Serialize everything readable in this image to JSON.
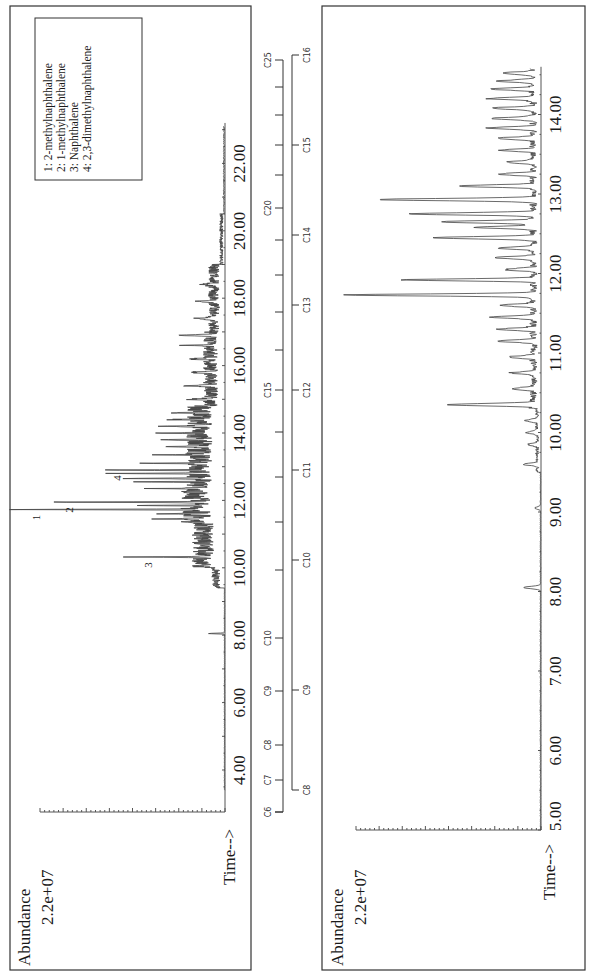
{
  "figure": {
    "orientation": "rotated-90-ccw",
    "panels": 2
  },
  "top_chart": {
    "ylabel": "Abundance",
    "ymax_label": "2.2e+07",
    "xlabel": "Time-->",
    "ticks": [
      "4.00",
      "6.00",
      "8.00",
      "10.00",
      "12.00",
      "14.00",
      "16.00",
      "18.00",
      "20.00",
      "22.00"
    ],
    "tick_values": [
      4,
      6,
      8,
      10,
      12,
      14,
      16,
      18,
      20,
      22
    ],
    "legend": [
      "1:  2-methylnaphthalene",
      "2:  1-methylnaphthalene",
      "3:  Naphthalene",
      "4:  2,3-dimethylnaphthalene"
    ],
    "peak_labels": [
      {
        "label": "1",
        "t": 11.73,
        "h": 1.0
      },
      {
        "label": "2",
        "t": 11.95,
        "h": 0.82
      },
      {
        "label": "3",
        "t": 10.32,
        "h": 0.39
      },
      {
        "label": "4",
        "t": 12.9,
        "h": 0.56
      }
    ]
  },
  "bottom_chart": {
    "ylabel": "Abundance",
    "ymax_label": "2.2e+07",
    "xlabel": "Time-->",
    "ticks": [
      "5.00",
      "6.00",
      "7.00",
      "8.00",
      "9.00",
      "10.00",
      "11.00",
      "12.00",
      "13.00",
      "14.00"
    ],
    "tick_values": [
      5,
      6,
      7,
      8,
      9,
      10,
      11,
      12,
      13,
      14
    ]
  },
  "carbon_scale_top": {
    "labels": [
      "C6",
      "C7",
      "C8",
      "C9",
      "C10",
      "C15",
      "C20",
      "C25"
    ],
    "label_positions": [
      6,
      7,
      8,
      9,
      10,
      15,
      20,
      25
    ]
  },
  "carbon_scale_bottom": {
    "labels": [
      "C8",
      "C9",
      "C10",
      "C11",
      "C12",
      "C13",
      "C14",
      "C15",
      "C16"
    ]
  },
  "chart_data": [
    {
      "type": "line",
      "title": "GC-MS total ion chromatogram (full range)",
      "xlabel": "Time-->",
      "ylabel": "Abundance",
      "xlim": [
        3.3,
        23.2
      ],
      "ylim": [
        0,
        22000000
      ],
      "x_ticks": [
        4,
        6,
        8,
        10,
        12,
        14,
        16,
        18,
        20,
        22
      ],
      "annotations": [
        {
          "peak": "1",
          "compound": "2-methylnaphthalene",
          "time_min": 11.73,
          "rel_abundance": 1.0
        },
        {
          "peak": "2",
          "compound": "1-methylnaphthalene",
          "time_min": 11.95,
          "rel_abundance": 0.82
        },
        {
          "peak": "3",
          "compound": "Naphthalene",
          "time_min": 10.32,
          "rel_abundance": 0.39
        },
        {
          "peak": "4",
          "compound": "2,3-dimethylnaphthalene",
          "time_min": 12.9,
          "rel_abundance": 0.56
        }
      ],
      "legend_position": "upper-right",
      "grid": false
    },
    {
      "type": "line",
      "title": "GC-MS total ion chromatogram (expanded 5-14.5 min)",
      "xlabel": "Time-->",
      "ylabel": "Abundance",
      "xlim": [
        5.0,
        14.6
      ],
      "ylim": [
        0,
        22000000
      ],
      "x_ticks": [
        5,
        6,
        7,
        8,
        9,
        10,
        11,
        12,
        13,
        14
      ],
      "major_peaks": [
        {
          "time_min": 11.73,
          "rel_abundance": 1.0
        },
        {
          "time_min": 11.92,
          "rel_abundance": 0.69
        },
        {
          "time_min": 12.93,
          "rel_abundance": 0.83
        },
        {
          "time_min": 12.75,
          "rel_abundance": 0.67
        },
        {
          "time_min": 10.35,
          "rel_abundance": 0.47
        },
        {
          "time_min": 12.45,
          "rel_abundance": 0.53
        },
        {
          "time_min": 12.65,
          "rel_abundance": 0.5
        },
        {
          "time_min": 8.05,
          "rel_abundance": 0.09
        }
      ],
      "grid": false
    }
  ]
}
